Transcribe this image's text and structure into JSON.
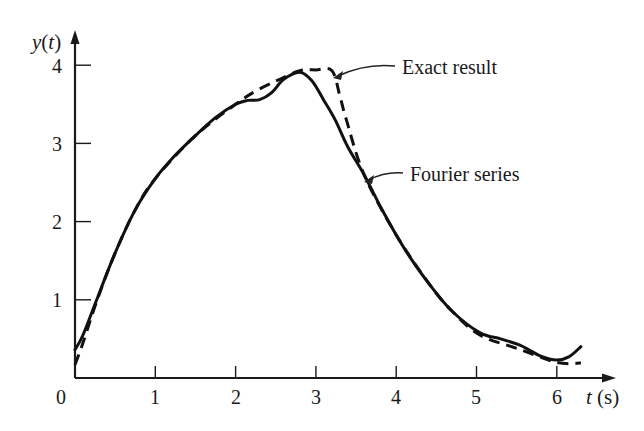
{
  "chart_data": {
    "type": "line",
    "title": "",
    "xlabel_var": "t",
    "xlabel_unit": "(s)",
    "ylabel_var": "y",
    "ylabel_arg": "(t)",
    "xlim": [
      0,
      6.6
    ],
    "ylim": [
      0,
      4.3
    ],
    "x_ticks": [
      1,
      2,
      3,
      4,
      5,
      6
    ],
    "y_ticks": [
      1,
      2,
      3,
      4
    ],
    "origin_label": "0",
    "grid": false,
    "legend": "annotations",
    "series": [
      {
        "name": "Fourier series",
        "style": "solid",
        "points": [
          [
            0.0,
            0.36
          ],
          [
            0.1,
            0.55
          ],
          [
            0.27,
            1.0
          ],
          [
            0.5,
            1.6
          ],
          [
            0.75,
            2.15
          ],
          [
            1.0,
            2.55
          ],
          [
            1.25,
            2.85
          ],
          [
            1.5,
            3.1
          ],
          [
            1.75,
            3.33
          ],
          [
            2.0,
            3.5
          ],
          [
            2.15,
            3.55
          ],
          [
            2.3,
            3.56
          ],
          [
            2.45,
            3.65
          ],
          [
            2.6,
            3.82
          ],
          [
            2.8,
            3.91
          ],
          [
            2.95,
            3.8
          ],
          [
            3.1,
            3.55
          ],
          [
            3.24,
            3.3
          ],
          [
            3.4,
            2.95
          ],
          [
            3.6,
            2.6
          ],
          [
            3.8,
            2.2
          ],
          [
            4.0,
            1.83
          ],
          [
            4.2,
            1.5
          ],
          [
            4.42,
            1.19
          ],
          [
            4.7,
            0.85
          ],
          [
            5.04,
            0.58
          ],
          [
            5.3,
            0.5
          ],
          [
            5.54,
            0.42
          ],
          [
            5.8,
            0.28
          ],
          [
            6.0,
            0.23
          ],
          [
            6.15,
            0.27
          ],
          [
            6.3,
            0.4
          ]
        ]
      },
      {
        "name": "Exact result",
        "style": "dashed",
        "points": [
          [
            0.0,
            0.17
          ],
          [
            0.1,
            0.45
          ],
          [
            0.27,
            0.98
          ],
          [
            0.5,
            1.6
          ],
          [
            0.75,
            2.15
          ],
          [
            1.0,
            2.55
          ],
          [
            1.5,
            3.1
          ],
          [
            2.0,
            3.5
          ],
          [
            2.27,
            3.68
          ],
          [
            2.55,
            3.82
          ],
          [
            2.8,
            3.93
          ],
          [
            3.0,
            3.94
          ],
          [
            3.2,
            3.93
          ],
          [
            3.3,
            3.6
          ],
          [
            3.38,
            3.3
          ],
          [
            3.6,
            2.6
          ],
          [
            4.0,
            1.83
          ],
          [
            4.42,
            1.19
          ],
          [
            4.7,
            0.85
          ],
          [
            5.04,
            0.55
          ],
          [
            5.5,
            0.38
          ],
          [
            6.0,
            0.2
          ],
          [
            6.3,
            0.19
          ]
        ]
      }
    ],
    "annotations": [
      {
        "text": "Exact result",
        "points_to_series": "Exact result",
        "at": [
          3.3,
          3.85
        ]
      },
      {
        "text": "Fourier series",
        "points_to_series": "Fourier series",
        "at": [
          3.62,
          2.55
        ]
      }
    ]
  },
  "labels": {
    "y_axis_var": "y",
    "y_axis_arg_open": "(",
    "y_axis_arg_var": "t",
    "y_axis_arg_close": ")",
    "x_axis_var": "t",
    "x_axis_unit": "(s)",
    "origin": "0",
    "x_ticks": [
      "1",
      "2",
      "3",
      "4",
      "5",
      "6"
    ],
    "y_ticks": [
      "1",
      "2",
      "3",
      "4"
    ],
    "annotation_exact": "Exact result",
    "annotation_fourier": "Fourier series"
  }
}
